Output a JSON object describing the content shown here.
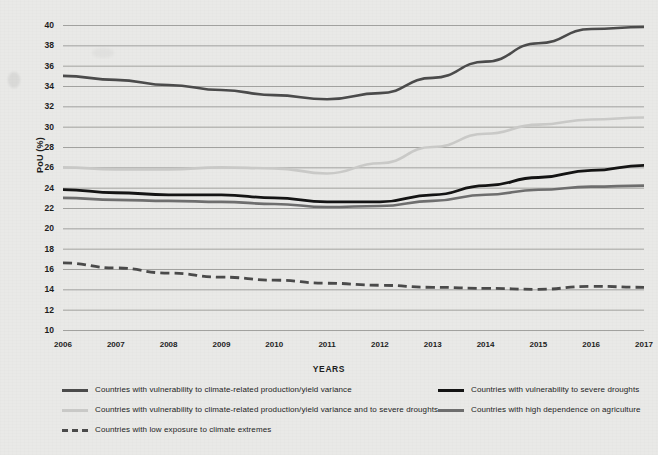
{
  "chart_data": {
    "type": "line",
    "title": "",
    "subtitle": "",
    "xlabel": "YEARS",
    "ylabel": "PoU (%)",
    "categories": [
      2006,
      2007,
      2008,
      2009,
      2010,
      2011,
      2012,
      2013,
      2014,
      2015,
      2016,
      2017
    ],
    "x_tick_labels": [
      "2006",
      "2007",
      "2008",
      "2009",
      "2010",
      "2011",
      "2012",
      "2013",
      "2014",
      "2015",
      "2016",
      "2017"
    ],
    "y_tick_labels": [
      "40",
      "38",
      "36",
      "34",
      "32",
      "30",
      "28",
      "26",
      "24",
      "22",
      "20",
      "18",
      "16",
      "14",
      "12",
      "10"
    ],
    "ylim": [
      10,
      40
    ],
    "xlim": [
      2006,
      2017
    ],
    "y_tick_step": 2,
    "grid": "horizontal",
    "legend_position": "bottom",
    "series": [
      {
        "name": "Countries with vulnerability to climate-related production/yield variance",
        "color": "#4b4b4b",
        "style": "solid",
        "width": 2.6,
        "values": [
          35.0,
          34.6,
          34.1,
          33.6,
          33.1,
          32.7,
          33.3,
          34.8,
          36.4,
          38.2,
          39.6,
          39.8
        ]
      },
      {
        "name": "Countries with vulnerability to climate-related production/yield variance and to severe droughts",
        "color": "#c9c9c7",
        "style": "solid",
        "width": 2.6,
        "values": [
          26.0,
          25.8,
          25.8,
          26.0,
          25.9,
          25.4,
          26.4,
          28.0,
          29.3,
          30.2,
          30.7,
          30.9
        ]
      },
      {
        "name": "Countries with low exposure to climate extremes",
        "color": "#4a4a4a",
        "style": "dashed",
        "width": 2.8,
        "values": [
          16.6,
          16.1,
          15.6,
          15.2,
          14.9,
          14.6,
          14.4,
          14.2,
          14.1,
          14.0,
          14.3,
          14.2
        ]
      },
      {
        "name": "Countries with vulnerability to severe droughts",
        "color": "#141414",
        "style": "solid",
        "width": 2.8,
        "values": [
          23.8,
          23.5,
          23.3,
          23.3,
          23.0,
          22.6,
          22.6,
          23.3,
          24.2,
          25.0,
          25.7,
          26.2
        ]
      },
      {
        "name": "Countries with high dependence on agriculture",
        "color": "#6e6e6e",
        "style": "solid",
        "width": 2.6,
        "values": [
          23.0,
          22.8,
          22.7,
          22.6,
          22.4,
          22.1,
          22.2,
          22.7,
          23.3,
          23.8,
          24.1,
          24.2
        ]
      }
    ]
  },
  "legend": {
    "items": [
      {
        "label": "Countries with vulnerability to climate-related production/yield variance",
        "color": "#4b4b4b",
        "style": "solid",
        "col": 0,
        "row": 0
      },
      {
        "label": "Countries with vulnerability to climate-related production/yield variance and to severe droughts",
        "color": "#c9c9c7",
        "style": "solid",
        "col": 0,
        "row": 1
      },
      {
        "label": "Countries with low exposure to climate extremes",
        "color": "#4a4a4a",
        "style": "dashed",
        "col": 0,
        "row": 2
      },
      {
        "label": "Countries with vulnerability to severe droughts",
        "color": "#141414",
        "style": "solid",
        "col": 1,
        "row": 0
      },
      {
        "label": "Countries with high dependence on agriculture",
        "color": "#6e6e6e",
        "style": "solid",
        "col": 1,
        "row": 1
      }
    ]
  },
  "axis": {
    "y_title": "PoU (%)",
    "x_title": "YEARS"
  },
  "colors": {
    "background": "#e9e9e7",
    "gridline": "#8f8f8d",
    "axis_text": "#1d1d1d"
  }
}
